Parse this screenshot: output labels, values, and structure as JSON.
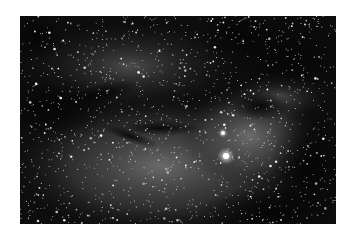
{
  "image": {
    "subject": "starfield with emission nebula and dark dust lanes",
    "colors": {
      "background": "#ffffff",
      "sky": "#0d0d0d",
      "nebula": "#6a6a6a",
      "star": "#ffffff"
    },
    "bright_stars": [
      {
        "x": 206,
        "y": 140,
        "r": 4
      },
      {
        "x": 203,
        "y": 117,
        "r": 2.5
      }
    ]
  }
}
